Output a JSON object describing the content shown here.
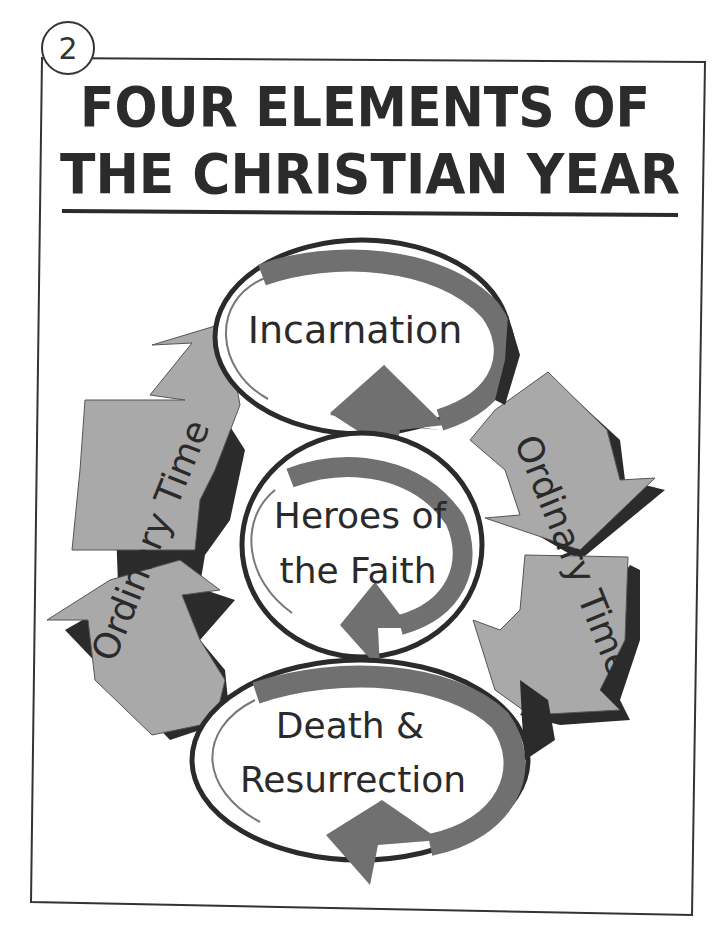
{
  "page": {
    "number": "2"
  },
  "title": {
    "line1": "FOUR ELEMENTS OF",
    "line2": "THE CHRISTIAN YEAR"
  },
  "diagram": {
    "elements": [
      {
        "id": "incarnation",
        "label_lines": [
          "Incarnation"
        ]
      },
      {
        "id": "heroes",
        "label_lines": [
          "Heroes of",
          "the Faith"
        ]
      },
      {
        "id": "death-resurrection",
        "label_lines": [
          "Death &",
          "Resurrection"
        ]
      },
      {
        "id": "ordinary-time-left",
        "label": "Ordinary Time"
      },
      {
        "id": "ordinary-time-right",
        "label": "Ordinary Time"
      }
    ],
    "colors": {
      "ink": "#2a2a2a",
      "arrow_fill": "#a9a9a9",
      "arrow_shadow": "#2b2b2b",
      "cycle_arrow": "#6e6e6e",
      "background": "#ffffff"
    }
  }
}
